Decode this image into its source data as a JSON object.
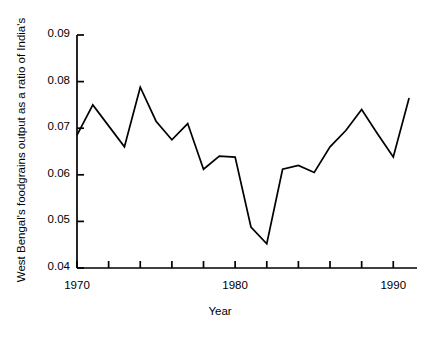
{
  "chart_data": {
    "type": "line",
    "title": "",
    "xlabel": "Year",
    "ylabel": "West Bengal's foodgrains output as a ratio of India's",
    "xlim": [
      1970,
      1991.5
    ],
    "ylim": [
      0.04,
      0.09
    ],
    "grid": false,
    "legend": false,
    "x": [
      1970,
      1971,
      1972,
      1973,
      1974,
      1975,
      1976,
      1977,
      1978,
      1979,
      1980,
      1981,
      1982,
      1983,
      1984,
      1985,
      1986,
      1987,
      1988,
      1989,
      1990,
      1991
    ],
    "values": [
      0.0685,
      0.075,
      0.0705,
      0.066,
      0.0788,
      0.0715,
      0.0675,
      0.071,
      0.0612,
      0.064,
      0.0638,
      0.0488,
      0.0452,
      0.0612,
      0.062,
      0.0605,
      0.066,
      0.0695,
      0.074,
      0.0688,
      0.0638,
      0.0765
    ],
    "series": [
      {
        "name": "West Bengal foodgrains ratio",
        "color": "#000000",
        "values": [
          0.0685,
          0.075,
          0.0705,
          0.066,
          0.0788,
          0.0715,
          0.0675,
          0.071,
          0.0612,
          0.064,
          0.0638,
          0.0488,
          0.0452,
          0.0612,
          0.062,
          0.0605,
          0.066,
          0.0695,
          0.074,
          0.0688,
          0.0638,
          0.0765
        ]
      }
    ],
    "yticks": [
      0.04,
      0.05,
      0.06,
      0.07,
      0.08,
      0.09
    ],
    "ytick_labels": [
      "0.04",
      "0.05",
      "0.06",
      "0.07",
      "0.08",
      "0.09"
    ],
    "xticks": [
      1970,
      1972,
      1974,
      1976,
      1978,
      1980,
      1982,
      1984,
      1986,
      1988,
      1990
    ],
    "xtick_labels": [
      "1970",
      "",
      "",
      "",
      "",
      "1980",
      "",
      "",
      "",
      "",
      "1990"
    ],
    "xtick_labels_shown": [
      "1970",
      "1980",
      "1990"
    ]
  },
  "axis": {
    "x_title": "Year",
    "y_title": "West Bengal's foodgrains output as a ratio of India's"
  },
  "ticks": {
    "y": [
      "0.09",
      "0.08",
      "0.07",
      "0.06",
      "0.05",
      "0.04"
    ],
    "x": [
      "1970",
      "1980",
      "1990"
    ]
  },
  "style": {
    "line_color": "#000000",
    "axis_color": "#000000",
    "background": "#ffffff"
  }
}
